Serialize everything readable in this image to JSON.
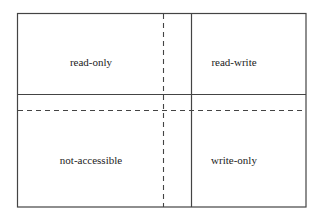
{
  "diagram": {
    "title": "",
    "colors": {
      "line": "#444444",
      "text": "#222222",
      "background": "#ffffff"
    },
    "frame": {
      "x1": 17,
      "y1": 13,
      "x2": 306,
      "y2": 207
    },
    "solid_lines": [
      {
        "orientation": "vertical",
        "position": 191,
        "label": "solid-vertical-divider"
      },
      {
        "orientation": "horizontal",
        "position": 94,
        "label": "solid-horizontal-divider"
      }
    ],
    "dashed_lines": [
      {
        "orientation": "vertical",
        "position": 163,
        "label": "dashed-vertical-divider"
      },
      {
        "orientation": "horizontal",
        "position": 110,
        "label": "dashed-horizontal-divider"
      }
    ],
    "regions": [
      {
        "id": "top-left",
        "label": "read-only",
        "cx": 91,
        "cy": 62
      },
      {
        "id": "top-right",
        "label": "read-write",
        "cx": 234,
        "cy": 62
      },
      {
        "id": "bottom-left",
        "label": "not-accessible",
        "cx": 91,
        "cy": 160
      },
      {
        "id": "bottom-right",
        "label": "write-only",
        "cx": 234,
        "cy": 160
      }
    ]
  }
}
